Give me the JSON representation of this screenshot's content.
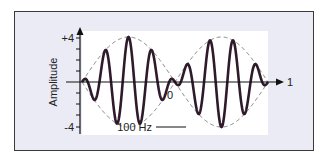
{
  "chart_data": {
    "type": "line",
    "title": "",
    "xlabel": "",
    "ylabel": "Amplitude",
    "ylim": [
      -4,
      4
    ],
    "y_ticks": [
      "+4",
      "-4"
    ],
    "x_tick_labels": [
      "0",
      "1"
    ],
    "annotation": "100 Hz",
    "series": [
      {
        "name": "beat waveform",
        "description": "carrier oscillation modulated by envelope, two beat lobes",
        "peak_amplitude": 4
      },
      {
        "name": "envelope",
        "style": "dashed",
        "description": "sinusoidal envelope crossing zero at x=0 (center)"
      }
    ],
    "grid": false,
    "legend": "none"
  },
  "labels": {
    "y_top": "+4",
    "y_bottom": "-4",
    "y_axis": "Amplitude",
    "x_zero": "0",
    "x_end": "1",
    "annotation": "100 Hz"
  },
  "colors": {
    "frame_bg": "#ebebf5",
    "plot_bg": "#ffffff",
    "wave": "#2e1a2a",
    "envelope": "#777777",
    "axis": "#111111"
  }
}
